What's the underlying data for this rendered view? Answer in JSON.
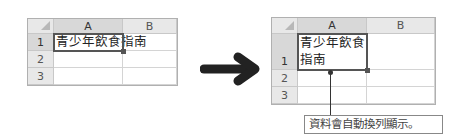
{
  "before": {
    "columns": [
      "A",
      "B"
    ],
    "rows": [
      "1",
      "2",
      "3"
    ],
    "cell_A1": "青少年飲食指南",
    "selected_cell": "A1"
  },
  "after": {
    "columns": [
      "A",
      "B"
    ],
    "rows": [
      "1",
      "2",
      "3"
    ],
    "cell_A1_line1": "青少年飲食",
    "cell_A1_line2": "指南",
    "selected_cell": "A1"
  },
  "arrow": {
    "icon": "right-arrow-icon",
    "color": "#222222"
  },
  "callout": {
    "text": "資料會自動換列顯示。"
  }
}
